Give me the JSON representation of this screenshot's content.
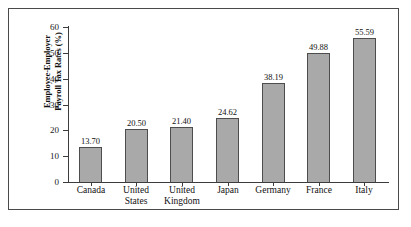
{
  "chart_data": {
    "type": "bar",
    "title": "",
    "xlabel": "",
    "ylabel_lines": [
      "Employee-Employer",
      "Payroll Tax Rates (%)"
    ],
    "ylabel": "Employee-Employer Payroll Tax Rates (%)",
    "categories": [
      "Canada",
      "United States",
      "United Kingdom",
      "Japan",
      "Germany",
      "France",
      "Italy"
    ],
    "category_lines": [
      [
        "Canada",
        ""
      ],
      [
        "United",
        "States"
      ],
      [
        "United",
        "Kingdom"
      ],
      [
        "Japan",
        ""
      ],
      [
        "Germany",
        ""
      ],
      [
        "France",
        ""
      ],
      [
        "Italy",
        ""
      ]
    ],
    "values": [
      13.7,
      20.5,
      21.4,
      24.62,
      38.19,
      49.88,
      55.59
    ],
    "value_labels": [
      "13.70",
      "20.50",
      "21.40",
      "24.62",
      "38.19",
      "49.88",
      "55.59"
    ],
    "ylim": [
      0,
      60
    ],
    "yticks": [
      0,
      10,
      20,
      30,
      40,
      50,
      60
    ],
    "ytick_labels": [
      "0",
      "10",
      "20",
      "30",
      "40",
      "50",
      "60"
    ],
    "grid": false,
    "legend": false,
    "legend_position": "none",
    "bar_color": "#a9a9a9",
    "bar_edge_color": "#4d4d4d",
    "axis_color": "#3c3c3c",
    "frame_color": "#4a4a4a",
    "background_color": "#ffffff"
  }
}
